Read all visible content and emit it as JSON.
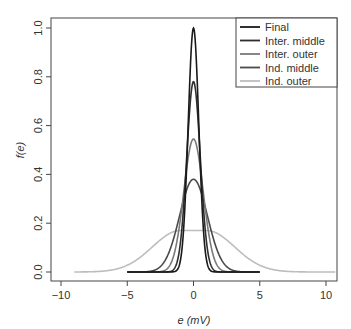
{
  "chart_data": {
    "type": "line",
    "title": "",
    "xlabel": "e (mV)",
    "ylabel": "f(e)",
    "xlim": [
      -10.5,
      11
    ],
    "ylim": [
      -0.03,
      1.04
    ],
    "xticks": [
      -10,
      -5,
      0,
      5,
      10
    ],
    "xtick_labels": [
      "−10",
      "−5",
      "0",
      "5",
      "10"
    ],
    "yticks": [
      0.0,
      0.2,
      0.4,
      0.6,
      0.8,
      1.0
    ],
    "ytick_labels": [
      "0.0",
      "0.2",
      "0.4",
      "0.6",
      "0.8",
      "1.0"
    ],
    "grid": false,
    "legend_position": "top-right",
    "series": [
      {
        "name": "Final",
        "color": "#1a1a1a",
        "peak": 1.0,
        "center": 0.0,
        "sd": 0.4,
        "x_range": [
          -5,
          5
        ],
        "flat_top": 0
      },
      {
        "name": "Inter. middle",
        "color": "#2e2e2e",
        "peak": 0.78,
        "center": 0.0,
        "sd": 0.51,
        "x_range": [
          -5,
          5
        ],
        "flat_top": 0
      },
      {
        "name": "Inter. outer",
        "color": "#7a7a7a",
        "peak": 0.545,
        "center": 0.0,
        "sd": 0.73,
        "x_range": [
          -5,
          5
        ],
        "flat_top": 0
      },
      {
        "name": "Ind. middle",
        "color": "#4a4a4a",
        "peak": 0.38,
        "center": 0.0,
        "sd": 1.05,
        "x_range": [
          -5,
          5
        ],
        "flat_top": 0
      },
      {
        "name": "Ind. outer",
        "color": "#bdbdbd",
        "peak": 0.17,
        "center": 0.0,
        "sd": 2.1,
        "x_range": [
          -9,
          10.7
        ],
        "flat_top": 1.0
      }
    ]
  }
}
